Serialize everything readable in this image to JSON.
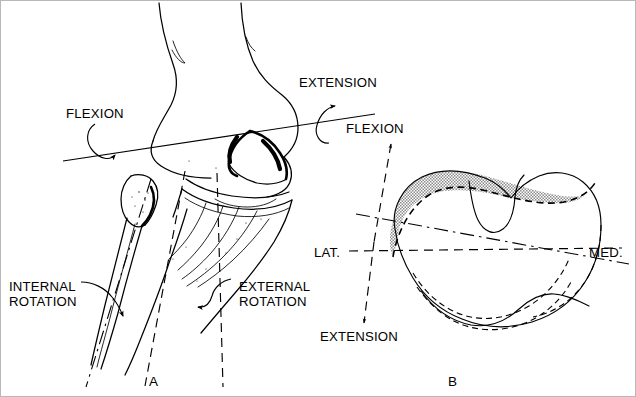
{
  "figure": {
    "kind": "anatomical-line-drawing",
    "background_color": "#ffffff",
    "ink_color": "#000000",
    "shade_color": "#b3b3b3"
  },
  "panel_a": {
    "label": "A",
    "labels": {
      "flexion": "FLEXION",
      "extension": "EXTENSION",
      "internal_rotation_line1": "INTERNAL",
      "internal_rotation_line2": "ROTATION",
      "external_rotation_line1": "EXTERNAL",
      "external_rotation_line2": "ROTATION"
    }
  },
  "panel_b": {
    "label": "B",
    "labels": {
      "flexion": "FLEXION",
      "extension": "EXTENSION",
      "lateral": "LAT.",
      "medial": "MED."
    }
  }
}
